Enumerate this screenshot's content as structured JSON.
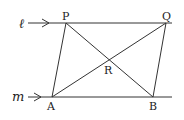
{
  "diagram": {
    "lines": [
      {
        "name": "l",
        "label": "ℓ",
        "y": 23
      },
      {
        "name": "m",
        "label": "m",
        "y": 97
      }
    ],
    "points": [
      {
        "label": "P",
        "x": 66,
        "y": 23
      },
      {
        "label": "Q",
        "x": 166,
        "y": 23
      },
      {
        "label": "A",
        "x": 52,
        "y": 97
      },
      {
        "label": "B",
        "x": 153,
        "y": 97
      },
      {
        "label": "R",
        "x": 110,
        "y": 60
      }
    ],
    "segments": [
      "PA",
      "QB",
      "PB",
      "AQ"
    ],
    "stroke": "#333333"
  }
}
